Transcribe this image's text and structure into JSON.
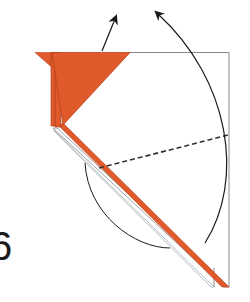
{
  "diagram": {
    "type": "origami-fold-step",
    "step_number": "6",
    "colors": {
      "paper_colored": "#e05a2b",
      "paper_colored_dark": "#b8431c",
      "paper_white": "#ffffff",
      "outline": "#8a8a8a",
      "arrow": "#1a1a1a",
      "fold_line": "#333333"
    },
    "elements": [
      {
        "id": "square-outline",
        "description": "white paper square edges (top and right)"
      },
      {
        "id": "orange-flap",
        "description": "colored triangular flap with layered edges"
      },
      {
        "id": "diagonal-strip",
        "description": "long diagonal folded edge, colored and white layers"
      },
      {
        "id": "valley-fold-line",
        "description": "dashed fold line"
      },
      {
        "id": "arrow-up-flap",
        "description": "straight arrow pointing up-right from flap"
      },
      {
        "id": "arrow-swing-arc",
        "description": "large curved arrow swinging up to top"
      },
      {
        "id": "arrow-lower-arc",
        "description": "lower curved arc under diagonal"
      }
    ]
  }
}
